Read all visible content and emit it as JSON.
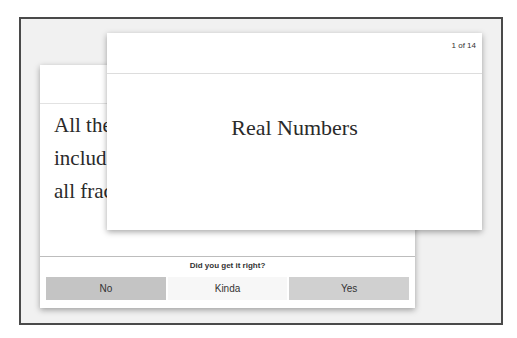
{
  "flashcards": {
    "back_card": {
      "text": "All the\ninclud\nall frac"
    },
    "front_card": {
      "counter": "1 of 14",
      "term": "Real Numbers"
    },
    "rating": {
      "question": "Did you get it right?",
      "buttons": [
        {
          "label": "No",
          "color": "#c4c4c4"
        },
        {
          "label": "Kinda",
          "color": "#f7f7f7"
        },
        {
          "label": "Yes",
          "color": "#d0d0d0"
        }
      ]
    }
  }
}
